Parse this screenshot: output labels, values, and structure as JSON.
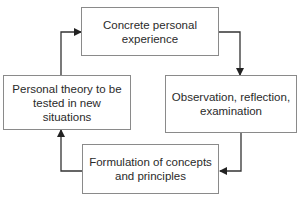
{
  "diagram": {
    "type": "cycle",
    "nodes": [
      {
        "id": "top",
        "label": "Concrete personal experience"
      },
      {
        "id": "right",
        "label": "Observation, reflection, examination"
      },
      {
        "id": "bottom",
        "label": "Formulation of concepts and principles"
      },
      {
        "id": "left",
        "label": "Personal theory to be tested in new situations"
      }
    ],
    "edges": [
      {
        "from": "top",
        "to": "right"
      },
      {
        "from": "right",
        "to": "bottom"
      },
      {
        "from": "bottom",
        "to": "left"
      },
      {
        "from": "left",
        "to": "top"
      }
    ],
    "colors": {
      "box_border": "#8a8a8a",
      "arrow": "#333333",
      "text": "#2a2a2a"
    }
  }
}
